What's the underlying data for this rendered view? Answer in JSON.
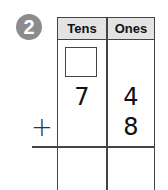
{
  "problem": {
    "number": "2",
    "badge_color": "#8c8c8c",
    "headers": [
      "Tens",
      "Ones"
    ],
    "top_addend": {
      "tens": "7",
      "ones": "4"
    },
    "bottom_addend": {
      "tens": "",
      "ones": "8"
    },
    "operator": "+",
    "regroup_box": "",
    "sum": {
      "tens": "",
      "ones": ""
    }
  }
}
